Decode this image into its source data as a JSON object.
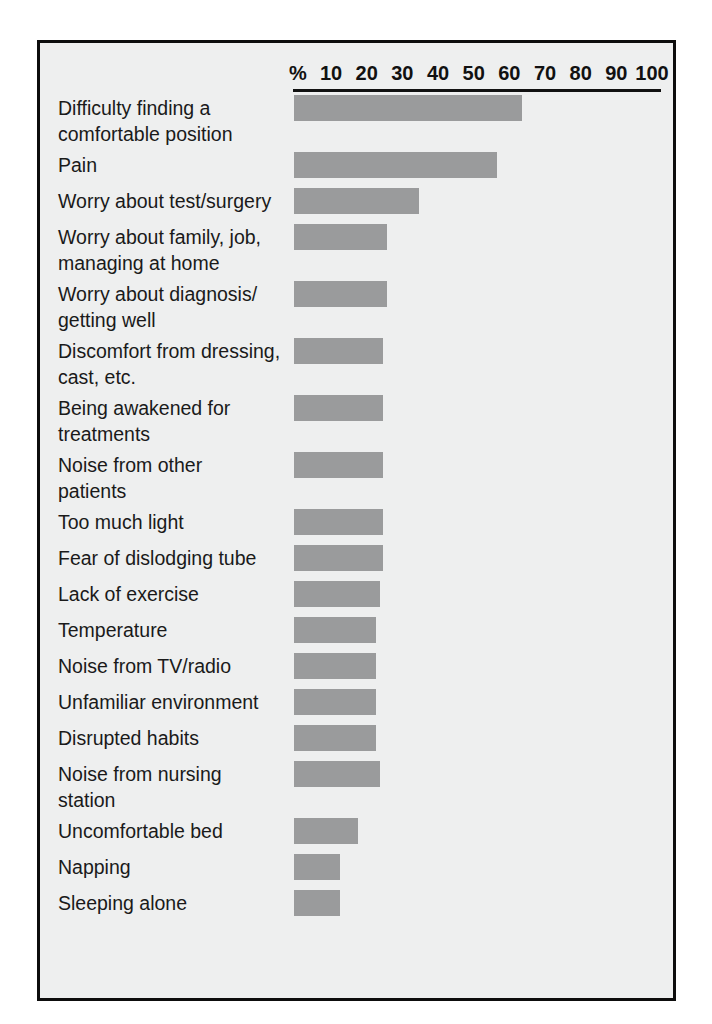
{
  "figure": {
    "background_color": "#eeefef",
    "border_color": "#0d0d0d",
    "bar_color": "#9a9b9c",
    "text_color": "#1a1a1a"
  },
  "axis": {
    "percent_symbol": "%",
    "ticks": [
      "10",
      "20",
      "30",
      "40",
      "50",
      "60",
      "70",
      "80",
      "90",
      "100"
    ]
  },
  "chart_data": {
    "type": "bar",
    "orientation": "horizontal",
    "title": "",
    "subtitle": "",
    "xlabel": "%",
    "ylabel": "",
    "xlim": [
      0,
      100
    ],
    "grid": false,
    "legend": null,
    "categories": [
      "Difficulty finding a comfortable position",
      "Pain",
      "Worry about test/surgery",
      "Worry about family, job, managing at home",
      "Worry about diagnosis/ getting well",
      "Discomfort from dressing, cast, etc.",
      "Being awakened for treatments",
      "Noise from other patients",
      "Too much light",
      "Fear of dislodging tube",
      "Lack of exercise",
      "Temperature",
      "Noise from TV/radio",
      "Unfamiliar environment",
      "Disrupted habits",
      "Noise from nursing station",
      "Uncomfortable bed",
      "Napping",
      "Sleeping alone"
    ],
    "values": [
      64,
      57,
      35,
      26,
      26,
      25,
      25,
      25,
      25,
      25,
      24,
      23,
      23,
      23,
      23,
      24,
      18,
      13,
      13
    ],
    "tick_values": [
      10,
      20,
      30,
      40,
      50,
      60,
      70,
      80,
      90,
      100
    ]
  },
  "rows": [
    {
      "label": "Difficulty finding a\ncomfortable position",
      "lines": 2,
      "value": 64
    },
    {
      "label": "Pain",
      "lines": 1,
      "value": 57
    },
    {
      "label": "Worry about test/surgery",
      "lines": 1,
      "value": 35
    },
    {
      "label": "Worry about family, job,\nmanaging at home",
      "lines": 2,
      "value": 26
    },
    {
      "label": "Worry about diagnosis/\ngetting well",
      "lines": 2,
      "value": 26
    },
    {
      "label": "Discomfort from dressing,\ncast, etc.",
      "lines": 2,
      "value": 25
    },
    {
      "label": "Being awakened for\ntreatments",
      "lines": 2,
      "value": 25
    },
    {
      "label": "Noise from other\npatients",
      "lines": 2,
      "value": 25
    },
    {
      "label": "Too much light",
      "lines": 1,
      "value": 25
    },
    {
      "label": "Fear of dislodging tube",
      "lines": 1,
      "value": 25
    },
    {
      "label": "Lack of exercise",
      "lines": 1,
      "value": 24
    },
    {
      "label": "Temperature",
      "lines": 1,
      "value": 23
    },
    {
      "label": "Noise from TV/radio",
      "lines": 1,
      "value": 23
    },
    {
      "label": "Unfamiliar environment",
      "lines": 1,
      "value": 23
    },
    {
      "label": "Disrupted habits",
      "lines": 1,
      "value": 23
    },
    {
      "label": "Noise from nursing\nstation",
      "lines": 2,
      "value": 24
    },
    {
      "label": "Uncomfortable bed",
      "lines": 1,
      "value": 18
    },
    {
      "label": "Napping",
      "lines": 1,
      "value": 13
    },
    {
      "label": "Sleeping alone",
      "lines": 1,
      "value": 13
    }
  ]
}
